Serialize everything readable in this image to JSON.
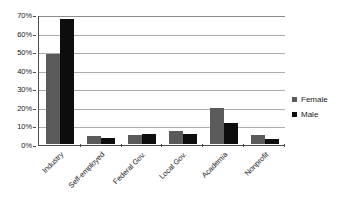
{
  "chart_data": {
    "type": "bar",
    "title": "",
    "subtitle": "",
    "xlabel": "",
    "ylabel": "",
    "orientation": "vertical",
    "grouping": "grouped",
    "grid": "horizontal",
    "legend_position": "right",
    "ylim": [
      0,
      70
    ],
    "ytick_step": 10,
    "ytick_labels": [
      "70%",
      "60%",
      "50%",
      "40%",
      "30%",
      "20%",
      "10%",
      "0%"
    ],
    "ytick_values": [
      70,
      60,
      50,
      40,
      30,
      20,
      10,
      0
    ],
    "value_unit": "percent",
    "categories": [
      "Industry",
      "Self-employed",
      "Federal Gov.",
      "Local Gov.",
      "Academia",
      "Nonprofit"
    ],
    "series": [
      {
        "name": "Female",
        "color": "#5a5a5a",
        "values": [
          48.5,
          4.5,
          5.0,
          7.0,
          19.5,
          5.0
        ]
      },
      {
        "name": "Male",
        "color": "#0d0d0d",
        "values": [
          67.5,
          3.0,
          5.5,
          5.5,
          11.5,
          2.5
        ]
      }
    ],
    "annotations": []
  },
  "legend": {
    "entries": [
      {
        "label": "Female",
        "marker": "square-gray"
      },
      {
        "label": "Male",
        "marker": "square-black"
      }
    ]
  },
  "colors": {
    "female_bar": "#5a5a5a",
    "male_bar": "#0d0d0d",
    "gridline": "#adadad",
    "axis_line": "#4d4d4d",
    "plot_background": "#ffffff",
    "text": "#1a1a1a"
  }
}
